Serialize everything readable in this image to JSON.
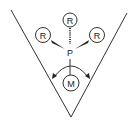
{
  "diagram": {
    "central_atom": "P",
    "metal": "M",
    "substituents": [
      "R",
      "R",
      "R"
    ],
    "colors": {
      "stroke": "#333333",
      "background": "#ffffff"
    }
  }
}
